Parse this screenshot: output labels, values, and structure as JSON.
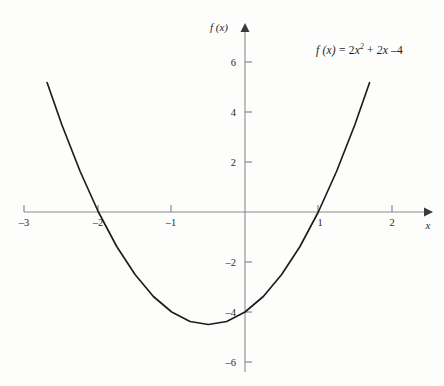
{
  "figure": {
    "background_color": "#fdfdfc",
    "curve_color": "#1c1c1c",
    "axis_color": "#8a8a8a",
    "equation_label": "f (x) = 2x² + 2x – 4",
    "equation_parts": {
      "fn": "f (x)",
      "equals": "=",
      "coef": "2",
      "var": "x",
      "exp": "2",
      "plus": "+",
      "linear": "2x",
      "minus": "–",
      "constant": "4"
    }
  },
  "axes": {
    "x_axis_name": "x",
    "y_axis_name": "f (x)",
    "x_ticks": [
      "–3",
      "–2",
      "–1",
      "1",
      "2"
    ],
    "x_tick_values": [
      -3,
      -2,
      -1,
      1,
      2
    ],
    "y_ticks": [
      "6",
      "4",
      "2",
      "–2",
      "–4",
      "–6"
    ],
    "y_tick_values": [
      6,
      4,
      2,
      -2,
      -4,
      -6
    ]
  },
  "chart_data": {
    "type": "line",
    "title": "",
    "subtitle": "",
    "xlabel": "x",
    "ylabel": "f (x)",
    "xlim": [
      -3.0,
      2.3
    ],
    "ylim": [
      -6.6,
      7.2
    ],
    "grid": false,
    "legend": "none",
    "annotations": [
      {
        "text": "f (x) = 2x² + 2x – 4",
        "x": 1.2,
        "y": 6.8
      }
    ],
    "series": [
      {
        "name": "f (x) = 2x² + 2x – 4",
        "equation": "f(x) = 2*x^2 + 2*x - 4",
        "color": "#1c1c1c",
        "domain": [
          -2.7,
          1.7
        ],
        "roots": [
          -2,
          1
        ],
        "vertex": [
          -0.5,
          -4.5
        ],
        "y_intercept": -4,
        "x": [
          -2.7,
          -2.5,
          -2.25,
          -2.0,
          -1.75,
          -1.5,
          -1.25,
          -1.0,
          -0.75,
          -0.5,
          -0.25,
          0.0,
          0.25,
          0.5,
          0.75,
          1.0,
          1.25,
          1.5,
          1.7
        ],
        "values": [
          5.18,
          3.5,
          1.63,
          0.0,
          -1.38,
          -2.5,
          -3.38,
          -4.0,
          -4.38,
          -4.5,
          -4.38,
          -4.0,
          -3.38,
          -2.5,
          -1.38,
          0.0,
          1.63,
          3.5,
          5.18
        ]
      }
    ]
  }
}
